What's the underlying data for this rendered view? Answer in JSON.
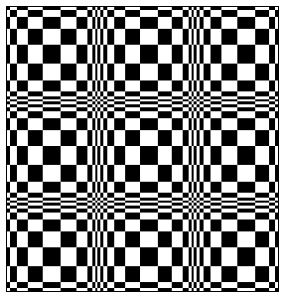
{
  "image": {
    "description": "Distorted black-and-white checkerboard optical illusion",
    "width": 284,
    "height": 300,
    "colors": {
      "dark": "#000000",
      "light": "#ffffff",
      "background": "#ffffff"
    }
  },
  "board": {
    "x": 6,
    "y": 6,
    "width": 273,
    "height": 286,
    "col_edges": [
      0,
      3,
      10,
      21,
      36,
      54,
      70,
      81,
      86,
      89,
      91,
      94,
      97,
      101,
      108,
      119,
      134,
      152,
      166,
      177,
      183,
      186,
      188,
      191,
      194,
      198,
      205,
      216,
      232,
      250,
      264,
      270,
      273
    ],
    "row_edges": [
      0,
      3,
      10,
      22,
      38,
      57,
      74,
      85,
      90,
      93,
      95,
      98,
      101,
      105,
      112,
      124,
      140,
      159,
      176,
      187,
      192,
      195,
      197,
      200,
      203,
      207,
      214,
      226,
      242,
      261,
      277,
      283,
      286
    ],
    "first_cell_dark": true
  }
}
